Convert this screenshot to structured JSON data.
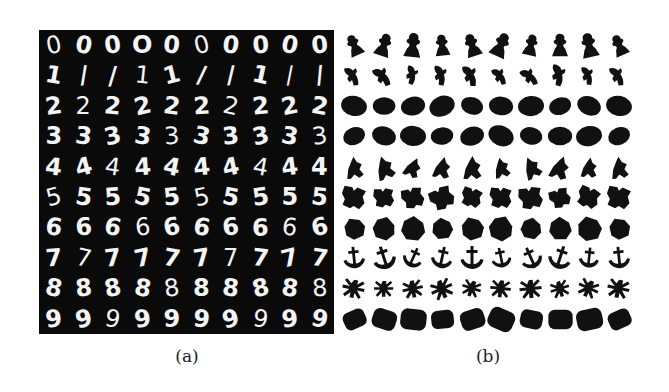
{
  "figure": {
    "panel_a": {
      "label": "(a)",
      "background": "#0a0a0a",
      "description": "MNIST handwritten digit samples, 10 per class",
      "rows": [
        {
          "digit": "0",
          "samples": [
            "0",
            "0",
            "0",
            "O",
            "0",
            "0",
            "0",
            "0",
            "0",
            "0"
          ]
        },
        {
          "digit": "1",
          "samples": [
            "1",
            "/",
            "/",
            "1",
            "1",
            "/",
            "/",
            "1",
            "/",
            "/"
          ]
        },
        {
          "digit": "2",
          "samples": [
            "2",
            "2",
            "2",
            "2",
            "2",
            "2",
            "2",
            "2",
            "2",
            "2"
          ]
        },
        {
          "digit": "3",
          "samples": [
            "3",
            "3",
            "3",
            "3",
            "3",
            "3",
            "3",
            "3",
            "3",
            "3"
          ]
        },
        {
          "digit": "4",
          "samples": [
            "4",
            "4",
            "4",
            "4",
            "4",
            "4",
            "4",
            "4",
            "4",
            "4"
          ]
        },
        {
          "digit": "5",
          "samples": [
            "5",
            "5",
            "5",
            "5",
            "5",
            "5",
            "5",
            "5",
            "5",
            "5"
          ]
        },
        {
          "digit": "6",
          "samples": [
            "6",
            "6",
            "6",
            "6",
            "6",
            "6",
            "6",
            "6",
            "6",
            "6"
          ]
        },
        {
          "digit": "7",
          "samples": [
            "7",
            "7",
            "7",
            "7",
            "7",
            "7",
            "7",
            "7",
            "7",
            "7"
          ]
        },
        {
          "digit": "8",
          "samples": [
            "8",
            "8",
            "8",
            "8",
            "8",
            "8",
            "8",
            "8",
            "8",
            "8"
          ]
        },
        {
          "digit": "9",
          "samples": [
            "9",
            "9",
            "9",
            "9",
            "9",
            "9",
            "9",
            "9",
            "9",
            "9"
          ]
        }
      ]
    },
    "panel_b": {
      "label": "(b)",
      "shape_color": "#111111",
      "description": "Binary silhouette shapes, 10 classes x 10 samples",
      "rows": [
        {
          "class": "figurine",
          "shape": "figurine"
        },
        {
          "class": "bird-like",
          "shape": "bird"
        },
        {
          "class": "ellipse",
          "shape": "ellipse"
        },
        {
          "class": "ellipse-2",
          "shape": "ellipse"
        },
        {
          "class": "irregular",
          "shape": "irregular"
        },
        {
          "class": "blocky",
          "shape": "blocky"
        },
        {
          "class": "polygon",
          "shape": "polygon"
        },
        {
          "class": "anchor",
          "shape": "anchor"
        },
        {
          "class": "insect",
          "shape": "insect"
        },
        {
          "class": "rounded-rect",
          "shape": "roundrect"
        }
      ]
    }
  }
}
